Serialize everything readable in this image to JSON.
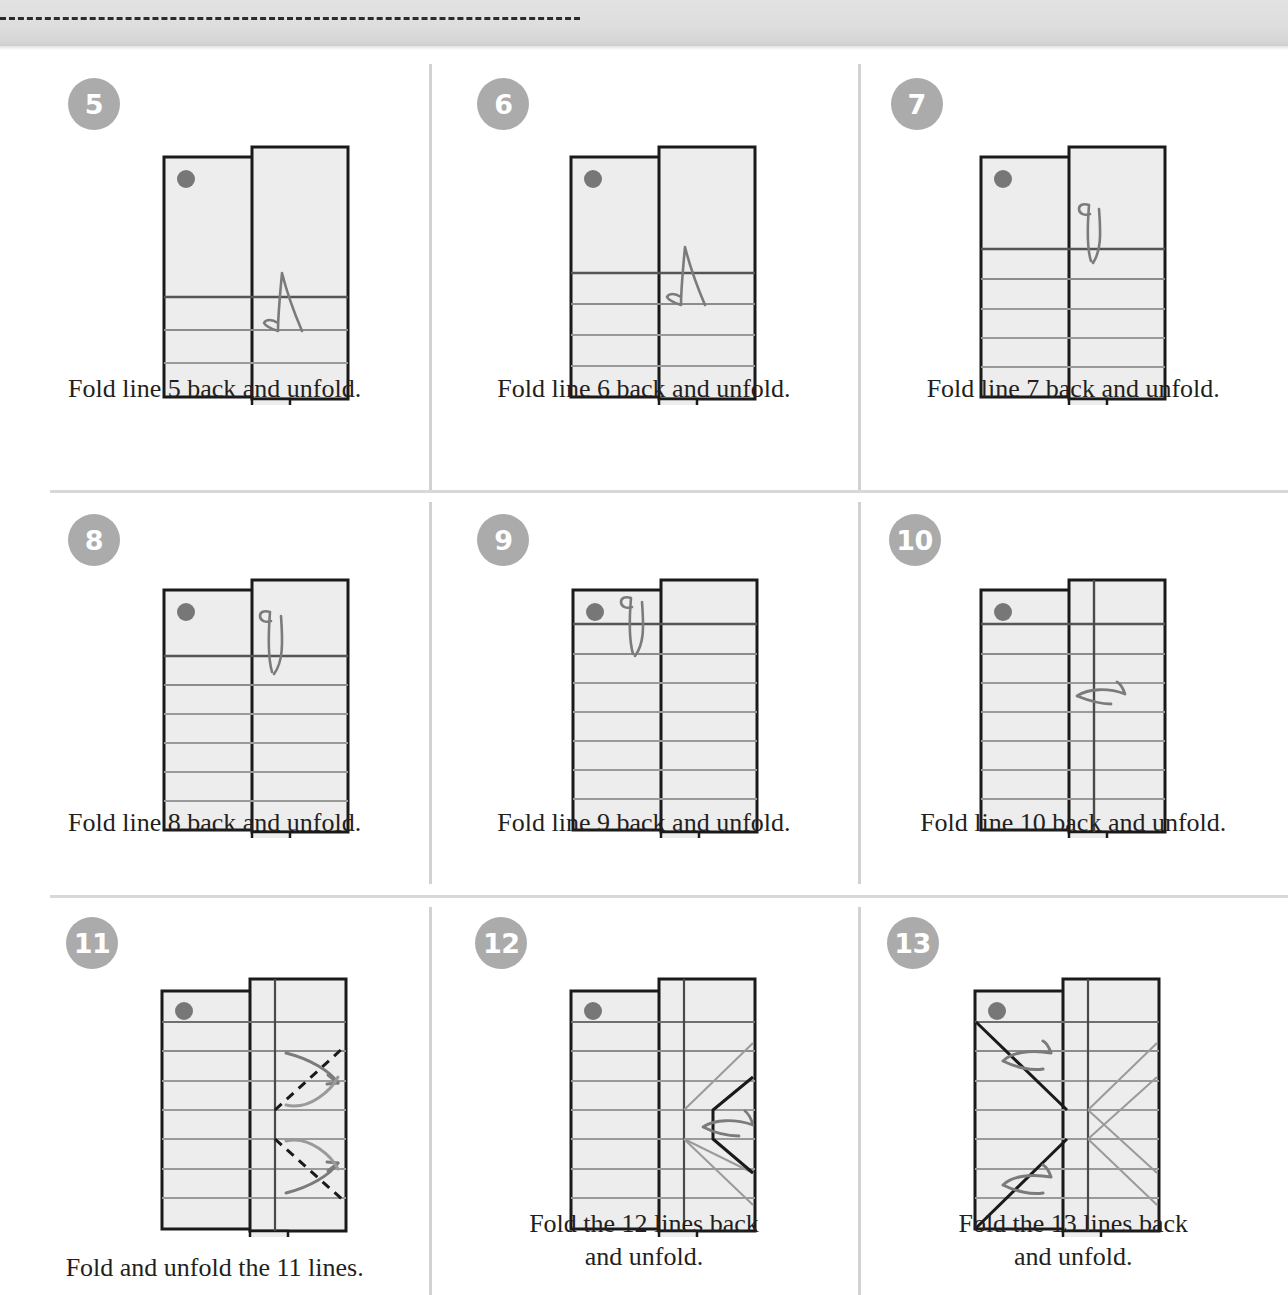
{
  "page": {
    "top_band_color": "#dedede",
    "dashed_line_color": "#2b2b2b",
    "badge_color": "#ababab",
    "paper_fill": "#ededed",
    "paper_stroke": "#1a1a1a",
    "crease_color": "#7a7a7a",
    "arrow_color": "#7b7b7b",
    "divider_color": "#d5d5d5"
  },
  "steps": [
    {
      "number": "5",
      "caption": "Fold line 5 back and unfold.",
      "caption_lines": [
        "Fold line 5 back and unfold."
      ],
      "horizontal_creases": 3,
      "vertical_crease": false,
      "arrow": "hook-down",
      "dot": true
    },
    {
      "number": "6",
      "caption": "Fold line 6 back and unfold.",
      "caption_lines": [
        "Fold line 6 back and unfold."
      ],
      "horizontal_creases": 4,
      "vertical_crease": false,
      "arrow": "hook-down",
      "dot": true
    },
    {
      "number": "7",
      "caption": "Fold line 7 back and unfold.",
      "caption_lines": [
        "Fold line 7 back and unfold."
      ],
      "horizontal_creases": 5,
      "vertical_crease": false,
      "arrow": "vee-down",
      "dot": true
    },
    {
      "number": "8",
      "caption": "Fold line 8 back and unfold.",
      "caption_lines": [
        "Fold line 8 back and unfold."
      ],
      "horizontal_creases": 6,
      "vertical_crease": false,
      "arrow": "vee-down",
      "dot": true
    },
    {
      "number": "9",
      "caption": "Fold line 9 back and unfold.",
      "caption_lines": [
        "Fold line 9 back and unfold."
      ],
      "horizontal_creases": 7,
      "vertical_crease": false,
      "arrow": "vee-down-top",
      "dot": true
    },
    {
      "number": "10",
      "caption": "Fold line 10 back and unfold.",
      "caption_lines": [
        "Fold line 10 back and unfold."
      ],
      "horizontal_creases": 7,
      "vertical_crease": true,
      "arrow": "sweep-left",
      "dot": true
    },
    {
      "number": "11",
      "caption": "Fold and unfold the 11 lines.",
      "caption_lines": [
        "Fold and unfold the 11 lines."
      ],
      "horizontal_creases": 7,
      "vertical_crease": true,
      "arrow": "two-curved-arrows",
      "dashed_diagonals": true,
      "dot": true
    },
    {
      "number": "12",
      "caption": "Fold the 12 lines back and unfold.",
      "caption_lines": [
        "Fold the 12 lines back",
        "and unfold."
      ],
      "horizontal_creases": 7,
      "vertical_crease": true,
      "arrow": "sweep-left",
      "chevron_creases": true,
      "dot": true
    },
    {
      "number": "13",
      "caption": "Fold the 13 lines back and unfold.",
      "caption_lines": [
        "Fold the 13 lines back",
        "and unfold."
      ],
      "horizontal_creases": 7,
      "vertical_crease": true,
      "arrow": "two-sweep-left",
      "symmetric_diagonals": true,
      "dot": true
    }
  ]
}
